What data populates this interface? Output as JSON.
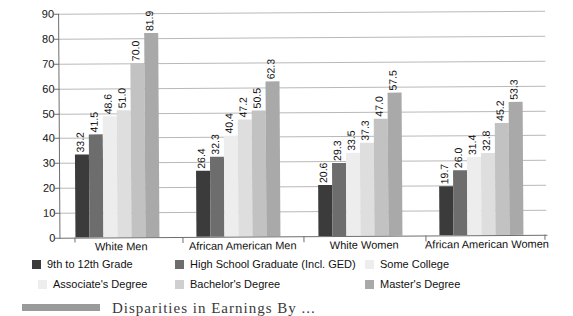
{
  "chart_data": {
    "type": "bar",
    "title": "",
    "xlabel": "",
    "ylabel": "",
    "ylim": [
      0,
      90
    ],
    "ytick_step": 10,
    "yticks": [
      0,
      10,
      20,
      30,
      40,
      50,
      60,
      70,
      80,
      90
    ],
    "grid": true,
    "legend_position": "bottom",
    "grouped": true,
    "value_labels": true,
    "value_label_rotation": -90,
    "categories": [
      "White Men",
      "African American Men",
      "White Women",
      "African American Women"
    ],
    "series": [
      {
        "name": "9th to 12th Grade",
        "color": "#3b3b3b",
        "values": [
          33.2,
          26.4,
          20.6,
          19.7
        ]
      },
      {
        "name": "High School Graduate (Incl. GED)",
        "color": "#6d6d6d",
        "values": [
          41.5,
          32.3,
          29.3,
          26.0
        ]
      },
      {
        "name": "Some College",
        "color": "#ededed",
        "values": [
          48.6,
          40.4,
          33.5,
          31.4
        ]
      },
      {
        "name": "Associate's Degree",
        "color": "#dedede",
        "values": [
          51.0,
          47.2,
          37.3,
          32.8
        ]
      },
      {
        "name": "Bachelor's Degree",
        "color": "#c2c2c2",
        "values": [
          70.0,
          50.5,
          47.0,
          45.2
        ]
      },
      {
        "name": "Master's Degree",
        "color": "#a9a9a9",
        "values": [
          81.9,
          62.3,
          57.5,
          53.3
        ]
      }
    ]
  },
  "legend": {
    "items": [
      {
        "label": "9th to 12th Grade",
        "color": "#3b3b3b"
      },
      {
        "label": "High School Graduate (Incl. GED)",
        "color": "#6d6d6d"
      },
      {
        "label": "Some College",
        "color": "#ededed"
      },
      {
        "label": "Associate's Degree",
        "color": "#ededed"
      },
      {
        "label": "Bachelor's Degree",
        "color": "#cfcfcf"
      },
      {
        "label": "Master's Degree",
        "color": "#a9a9a9"
      }
    ]
  },
  "caption": {
    "text": "Disparities in Earnings By ..."
  }
}
